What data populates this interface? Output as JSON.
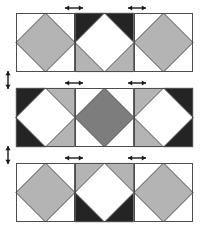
{
  "figure": {
    "width": 213,
    "height": 226
  },
  "palette": {
    "white": "#ffffff",
    "light_gray": "#b4b4b4",
    "medium_gray": "#7d7d7d",
    "dark": "#242424",
    "outline": "#4d4d4d",
    "arrow": "#1a1a1a",
    "background": "#ffffff"
  },
  "geometry": {
    "tile_size": 59,
    "rows": [
      {
        "name": "row-top",
        "x": 16,
        "y": 13,
        "tiles": 3
      },
      {
        "name": "row-middle",
        "x": 16,
        "y": 88,
        "tiles": 3
      },
      {
        "name": "row-bottom",
        "x": 16,
        "y": 163,
        "tiles": 3
      }
    ]
  },
  "tiles": [
    {
      "id": "tile-r1c1",
      "row": 1,
      "col": 1,
      "diamond": "light_gray",
      "corners": {
        "top_left": "white",
        "top_right": "white",
        "bottom_right": "white",
        "bottom_left": "white"
      }
    },
    {
      "id": "tile-r1c2",
      "row": 1,
      "col": 2,
      "diamond": "white",
      "corners": {
        "top_left": "dark",
        "top_right": "dark",
        "bottom_right": "light_gray",
        "bottom_left": "light_gray"
      }
    },
    {
      "id": "tile-r1c3",
      "row": 1,
      "col": 3,
      "diamond": "light_gray",
      "corners": {
        "top_left": "white",
        "top_right": "white",
        "bottom_right": "white",
        "bottom_left": "white"
      }
    },
    {
      "id": "tile-r2c1",
      "row": 2,
      "col": 1,
      "diamond": "white",
      "corners": {
        "top_left": "dark",
        "top_right": "light_gray",
        "bottom_right": "light_gray",
        "bottom_left": "dark"
      }
    },
    {
      "id": "tile-r2c2",
      "row": 2,
      "col": 2,
      "diamond": "medium_gray",
      "corners": {
        "top_left": "white",
        "top_right": "white",
        "bottom_right": "white",
        "bottom_left": "white"
      }
    },
    {
      "id": "tile-r2c3",
      "row": 2,
      "col": 3,
      "diamond": "white",
      "corners": {
        "top_left": "light_gray",
        "top_right": "dark",
        "bottom_right": "dark",
        "bottom_left": "light_gray"
      }
    },
    {
      "id": "tile-r3c1",
      "row": 3,
      "col": 1,
      "diamond": "light_gray",
      "corners": {
        "top_left": "white",
        "top_right": "white",
        "bottom_right": "white",
        "bottom_left": "white"
      }
    },
    {
      "id": "tile-r3c2",
      "row": 3,
      "col": 2,
      "diamond": "white",
      "corners": {
        "top_left": "light_gray",
        "top_right": "light_gray",
        "bottom_right": "dark",
        "bottom_left": "dark"
      }
    },
    {
      "id": "tile-r3c3",
      "row": 3,
      "col": 3,
      "diamond": "light_gray",
      "corners": {
        "top_left": "white",
        "top_right": "white",
        "bottom_right": "white",
        "bottom_left": "white"
      }
    }
  ],
  "arrows": {
    "horizontal": [
      {
        "id": "arrow-h-r1-a",
        "row": 1,
        "cx": 74,
        "cy": 8,
        "length": 18
      },
      {
        "id": "arrow-h-r1-b",
        "row": 1,
        "cx": 137,
        "cy": 8,
        "length": 18
      },
      {
        "id": "arrow-h-r2-a",
        "row": 2,
        "cx": 74,
        "cy": 83,
        "length": 18
      },
      {
        "id": "arrow-h-r2-b",
        "row": 2,
        "cx": 137,
        "cy": 83,
        "length": 18
      },
      {
        "id": "arrow-h-r3-a",
        "row": 3,
        "cx": 74,
        "cy": 158,
        "length": 18
      },
      {
        "id": "arrow-h-r3-b",
        "row": 3,
        "cx": 137,
        "cy": 158,
        "length": 18
      }
    ],
    "vertical": [
      {
        "id": "arrow-v-1",
        "cx": 8,
        "cy": 80,
        "length": 18
      },
      {
        "id": "arrow-v-2",
        "cx": 8,
        "cy": 155,
        "length": 18
      }
    ]
  }
}
